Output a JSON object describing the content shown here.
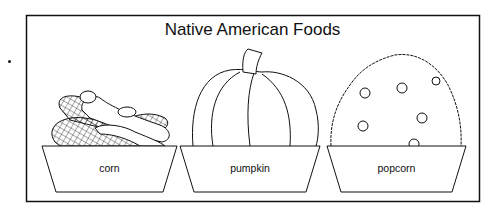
{
  "title": "Native American Foods",
  "items": [
    {
      "label": "corn",
      "icon": "corn-icon"
    },
    {
      "label": "pumpkin",
      "icon": "pumpkin-icon"
    },
    {
      "label": "popcorn",
      "icon": "popcorn-icon"
    }
  ],
  "colors": {
    "ink": "#111111",
    "background": "#ffffff"
  }
}
